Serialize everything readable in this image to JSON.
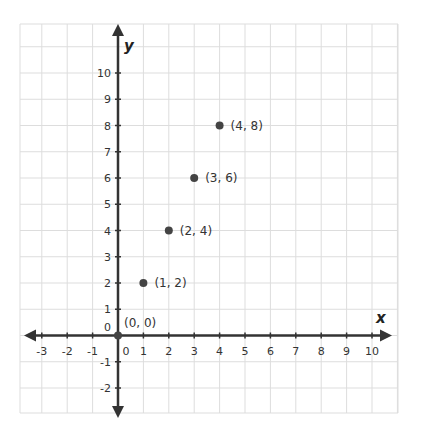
{
  "chart_data": {
    "type": "scatter",
    "title": "",
    "xlabel": "x",
    "ylabel": "y",
    "xlim": [
      -3.85,
      11.1
    ],
    "ylim": [
      -3,
      11.8
    ],
    "grid": true,
    "x_ticks": [
      "-3",
      "-2",
      "-1",
      "0",
      "1",
      "2",
      "3",
      "4",
      "5",
      "6",
      "7",
      "8",
      "9",
      "10"
    ],
    "y_ticks": [
      "-2",
      "-1",
      "0",
      "1",
      "2",
      "3",
      "4",
      "5",
      "6",
      "7",
      "8",
      "9",
      "10"
    ],
    "series": [
      {
        "name": "points",
        "x": [
          0,
          1,
          2,
          3,
          4
        ],
        "y": [
          0,
          2,
          4,
          6,
          8
        ],
        "labels": [
          "(0, 0)",
          "(1, 2)",
          "(2, 4)",
          "(3, 6)",
          "(4, 8)"
        ]
      }
    ],
    "colors": {
      "grid": "#dddddd",
      "axis": "#333333",
      "point": "#444444"
    }
  }
}
